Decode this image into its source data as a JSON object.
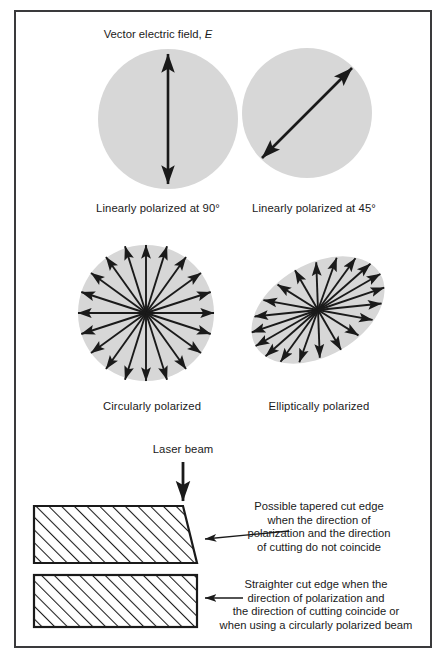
{
  "figure": {
    "name": "laser-beam-polarization-diagram",
    "border_color": "#3a3a3c",
    "disc_fill": "#d7d7d7",
    "ink_color": "#1a1a1a",
    "background": "#ffffff"
  },
  "top_label": {
    "prefix": "Vector electric field, ",
    "symbol": "E"
  },
  "panels": [
    {
      "id": "linear-90",
      "shape": "circle",
      "caption": "Linearly polarized at 90°",
      "arrow_angle_deg": 90,
      "arrow_heads": "both"
    },
    {
      "id": "linear-45",
      "shape": "circle",
      "caption": "Linearly polarized at 45°",
      "arrow_angle_deg": 45,
      "arrow_heads": "both"
    },
    {
      "id": "circular",
      "shape": "circle",
      "caption": "Circularly polarized",
      "ray_count": 20,
      "arrow_heads": "outward"
    },
    {
      "id": "elliptical",
      "shape": "ellipse",
      "caption": "Elliptically polarized",
      "ray_count": 20,
      "ellipse_rotation_deg": -30,
      "arrow_heads": "outward"
    }
  ],
  "cutting": {
    "beam_label": "Laser beam",
    "tapered": {
      "shape": "trapezoid",
      "hatch": "diagonal",
      "note_lines": [
        "Possible tapered cut edge",
        "when the direction of",
        "polarization and the direction",
        "of cutting do not coincide"
      ]
    },
    "straight": {
      "shape": "rectangle",
      "hatch": "diagonal",
      "note_lines": [
        "Straighter cut edge when the",
        "direction of polarization and",
        "the direction of cutting coincide or",
        "when using a circularly polarized beam"
      ]
    }
  }
}
